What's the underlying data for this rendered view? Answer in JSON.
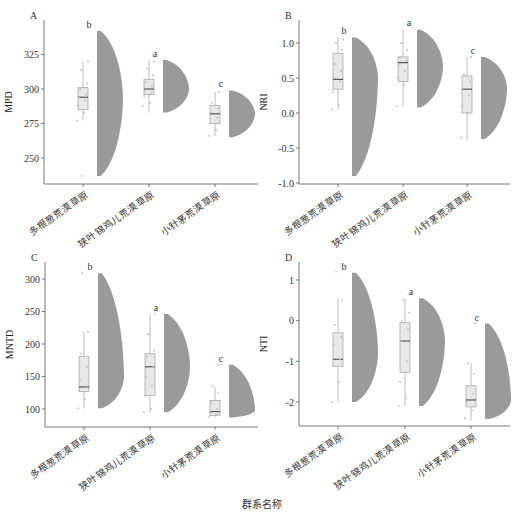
{
  "figure": {
    "x_title": "群系名称",
    "categories": [
      "多根葱荒漠草原",
      "狭叶锦鸡儿荒漠草原",
      "小针茅荒漠草原"
    ]
  },
  "chart_data": [
    {
      "panel": "A",
      "type": "raincloud",
      "ylabel": "MPD",
      "yticks": [
        250,
        275,
        300,
        325
      ],
      "ylim": [
        232,
        343
      ],
      "categories": [
        "多根葱荒漠草原",
        "狭叶锦鸡儿荒漠草原",
        "小针茅荒漠草原"
      ],
      "groups": [
        {
          "letter": "b",
          "min": 277,
          "q1": 285,
          "median": 294,
          "q3": 301,
          "max": 320,
          "violin_min": 237,
          "violin_max": 342,
          "violin_peak": 293,
          "points": [
            277,
            283,
            288,
            292,
            294,
            296,
            300,
            304,
            314,
            320,
            237
          ]
        },
        {
          "letter": "a",
          "min": 283,
          "q1": 296,
          "median": 300,
          "q3": 307,
          "max": 321,
          "violin_min": 283,
          "violin_max": 321,
          "violin_peak": 300,
          "points": [
            288,
            290,
            295,
            297,
            299,
            302,
            305,
            310,
            315,
            320
          ]
        },
        {
          "letter": "c",
          "min": 266,
          "q1": 275,
          "median": 282,
          "q3": 288,
          "max": 298,
          "violin_min": 265,
          "violin_max": 299,
          "violin_peak": 282,
          "points": [
            266,
            270,
            275,
            279,
            283,
            286,
            290,
            298
          ]
        }
      ]
    },
    {
      "panel": "B",
      "type": "raincloud",
      "ylabel": "NRI",
      "yticks": [
        -1.0,
        -0.5,
        0.0,
        0.5,
        1.0
      ],
      "ytick_labels": [
        "-1.0",
        "-0.5",
        "0.0",
        "0.5",
        "1.0"
      ],
      "ylim": [
        -1.0,
        1.25
      ],
      "categories": [
        "多根葱荒漠草原",
        "狭叶锦鸡儿荒漠草原",
        "小针茅荒漠草原"
      ],
      "groups": [
        {
          "letter": "b",
          "min": 0.05,
          "q1": 0.34,
          "median": 0.48,
          "q3": 0.85,
          "max": 1.08,
          "violin_min": -0.9,
          "violin_max": 1.08,
          "violin_peak": 0.5,
          "points": [
            0.05,
            0.12,
            0.3,
            0.45,
            0.5,
            0.6,
            0.7,
            0.9,
            1.0,
            1.05
          ]
        },
        {
          "letter": "a",
          "min": 0.1,
          "q1": 0.45,
          "median": 0.72,
          "q3": 0.8,
          "max": 1.2,
          "violin_min": 0.08,
          "violin_max": 1.19,
          "violin_peak": 0.66,
          "points": [
            0.1,
            0.4,
            0.5,
            0.6,
            0.7,
            0.75,
            0.8,
            0.9,
            1.0
          ]
        },
        {
          "letter": "c",
          "min": -0.38,
          "q1": 0.0,
          "median": 0.34,
          "q3": 0.53,
          "max": 0.8,
          "violin_min": -0.37,
          "violin_max": 0.8,
          "violin_peak": 0.35,
          "points": [
            -0.35,
            0.0,
            0.1,
            0.25,
            0.35,
            0.45,
            0.55,
            0.8
          ]
        }
      ]
    },
    {
      "panel": "C",
      "type": "raincloud",
      "ylabel": "MNTD",
      "yticks": [
        100,
        150,
        200,
        250,
        300
      ],
      "ylim": [
        73,
        320
      ],
      "categories": [
        "多根葱荒漠草原",
        "狭叶锦鸡儿荒漠草原",
        "小针茅荒漠草原"
      ],
      "groups": [
        {
          "letter": "b",
          "min": 101,
          "q1": 127,
          "median": 134,
          "q3": 181,
          "max": 219,
          "violin_min": 101,
          "violin_max": 309,
          "violin_peak": 150,
          "points": [
            101,
            115,
            128,
            135,
            145,
            165,
            185,
            219,
            309
          ]
        },
        {
          "letter": "a",
          "min": 95,
          "q1": 121,
          "median": 165,
          "q3": 185,
          "max": 246,
          "violin_min": 95,
          "violin_max": 246,
          "violin_peak": 165,
          "points": [
            95,
            100,
            120,
            135,
            150,
            165,
            180,
            190,
            215,
            246
          ]
        },
        {
          "letter": "c",
          "min": 88,
          "q1": 90,
          "median": 96,
          "q3": 113,
          "max": 135,
          "violin_min": 87,
          "violin_max": 168,
          "violin_peak": 98,
          "points": [
            88,
            92,
            95,
            100,
            110,
            125,
            135,
            168
          ]
        }
      ]
    },
    {
      "panel": "D",
      "type": "raincloud",
      "ylabel": "NTI",
      "yticks": [
        -2,
        -1,
        0,
        1
      ],
      "ylim": [
        -2.6,
        1.3
      ],
      "categories": [
        "多根葱荒漠草原",
        "狭叶锦鸡儿荒漠草原",
        "小针茅荒漠草原"
      ],
      "groups": [
        {
          "letter": "b",
          "min": -2.0,
          "q1": -1.12,
          "median": -0.95,
          "q3": -0.3,
          "max": 0.55,
          "violin_min": -2.0,
          "violin_max": 1.18,
          "violin_peak": -0.8,
          "points": [
            -2.0,
            -1.5,
            -1.1,
            -0.95,
            -0.6,
            -0.4,
            -0.1,
            0.5,
            1.2
          ]
        },
        {
          "letter": "a",
          "min": -2.1,
          "q1": -1.27,
          "median": -0.5,
          "q3": -0.05,
          "max": 0.55,
          "violin_min": -2.1,
          "violin_max": 0.55,
          "violin_peak": -0.5,
          "points": [
            -2.1,
            -1.9,
            -1.5,
            -1.0,
            -0.5,
            -0.2,
            0.0,
            0.2,
            0.5
          ]
        },
        {
          "letter": "c",
          "min": -2.45,
          "q1": -2.12,
          "median": -1.95,
          "q3": -1.6,
          "max": -1.05,
          "violin_min": -2.42,
          "violin_max": -0.07,
          "violin_peak": -1.95,
          "points": [
            -2.4,
            -2.2,
            -2.0,
            -1.8,
            -1.6,
            -1.3,
            -1.05,
            -0.07
          ]
        }
      ]
    }
  ]
}
